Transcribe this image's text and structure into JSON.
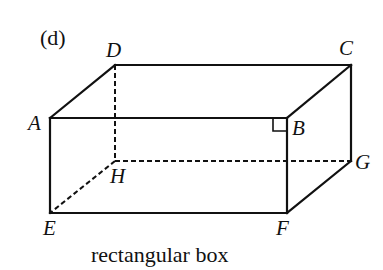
{
  "figure": {
    "part_label": "(d)",
    "caption": "rectangular box",
    "stroke_color": "#111111"
  },
  "vertices": {
    "A": {
      "label": "A",
      "x": 50,
      "y": 118
    },
    "B": {
      "label": "B",
      "x": 287,
      "y": 118
    },
    "C": {
      "label": "C",
      "x": 351,
      "y": 65
    },
    "D": {
      "label": "D",
      "x": 115,
      "y": 65
    },
    "E": {
      "label": "E",
      "x": 50,
      "y": 213
    },
    "F": {
      "label": "F",
      "x": 287,
      "y": 213
    },
    "G": {
      "label": "G",
      "x": 351,
      "y": 161
    },
    "H": {
      "label": "H",
      "x": 115,
      "y": 161
    }
  },
  "edges": {
    "solid": [
      "A-B",
      "B-F",
      "F-E",
      "E-A",
      "A-D",
      "D-C",
      "C-B",
      "C-G",
      "G-F"
    ],
    "hidden_dashed": [
      "D-H",
      "H-G",
      "H-E"
    ]
  },
  "annotations": {
    "right_angle_marker": "B"
  }
}
